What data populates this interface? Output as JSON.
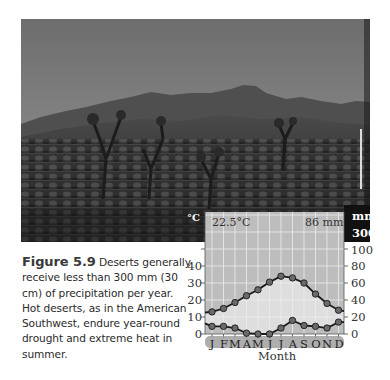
{
  "figure": {
    "label": "Figure 5.9",
    "caption": "Deserts generally receive less than 300 mm (30 cm) of precipitation per year. Hot deserts, as in the American Southwest, endure year-round drought and extreme heat in summer.",
    "photo_description": "Desert landscape with Joshua trees, shrubs, and mountains under a clear sky"
  },
  "chart": {
    "header_temperature": "22.5°C",
    "header_precipitation": "86 mm",
    "left_unit": "°C",
    "right_unit": "mm",
    "right_top_label": "300",
    "left_ticks": [
      "40",
      "30",
      "20",
      "10",
      "0"
    ],
    "right_ticks": [
      "100",
      "80",
      "60",
      "40",
      "20",
      "0"
    ],
    "months": [
      "J",
      "F",
      "M",
      "A",
      "M",
      "J",
      "J",
      "A",
      "S",
      "O",
      "N",
      "D"
    ],
    "xlabel": "Month"
  },
  "chart_data": {
    "type": "line",
    "title": "",
    "subtitle_left": "22.5°C",
    "subtitle_right": "86 mm",
    "categories": [
      "J",
      "F",
      "M",
      "A",
      "M",
      "J",
      "J",
      "A",
      "S",
      "O",
      "N",
      "D"
    ],
    "series": [
      {
        "name": "Temperature (°C)",
        "axis": "left",
        "values": [
          13,
          15,
          18.5,
          22.5,
          26,
          30.5,
          34,
          33,
          30,
          23.5,
          18,
          14
        ]
      },
      {
        "name": "Precipitation (mm)",
        "axis": "right",
        "values": [
          9,
          9,
          7,
          1,
          0,
          0,
          7,
          16,
          10,
          9,
          7,
          14
        ]
      }
    ],
    "xlabel": "Month",
    "ylabel_left": "°C",
    "ylabel_right": "mm",
    "ylim_left": [
      0,
      50
    ],
    "ylim_right": [
      0,
      100
    ],
    "right_axis_break_label": "300",
    "grid": true,
    "legend": "none"
  }
}
